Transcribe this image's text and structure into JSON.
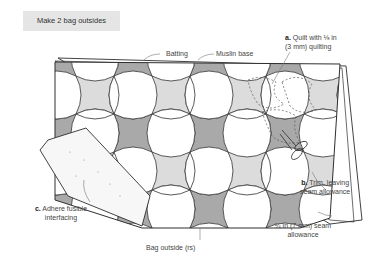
{
  "header": {
    "title": "Make 2 bag outsides"
  },
  "labels": {
    "batting": "Batting",
    "muslin": "Muslin base",
    "step_a_letter": "a.",
    "step_a_line1": "Quilt with ⅛ in",
    "step_a_line2": "(3 mm) quilting",
    "step_b_letter": "b.",
    "step_b_line1": "Trim, leaving",
    "step_b_line2": "seam allowance",
    "step_c_letter": "c.",
    "step_c_line1": "Adhere fusible",
    "step_c_line2": "interfacing",
    "bag_outside": "Bag outside (rs)",
    "seam_line1": "¼ in (7 mm) seam",
    "seam_line2": "allowance"
  },
  "colors": {
    "header_bg": "#e5e5e5",
    "dark_fabric": "#a9a9a9",
    "light_fabric": "#dcdcdc",
    "outline": "#2e2e2e",
    "interfacing": "#f7f7f7"
  }
}
